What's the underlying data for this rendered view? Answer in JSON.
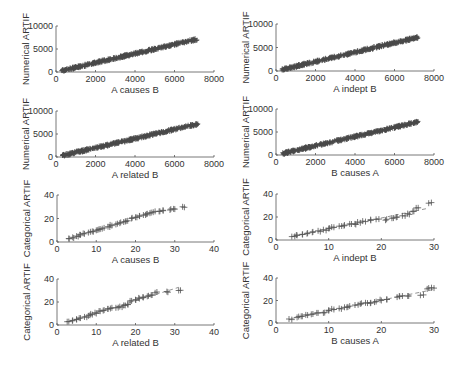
{
  "chart_data": [
    {
      "type": "scatter",
      "panel": 1,
      "xlabel": "A causes B",
      "ylabel": "Numerical ARTIF",
      "xlim": [
        0,
        8000
      ],
      "ylim": [
        0,
        10000
      ],
      "xticks": [
        0,
        2000,
        4000,
        6000,
        8000
      ],
      "yticks": [
        0,
        5000,
        10000
      ],
      "marker": "+",
      "x_range": [
        300,
        7200
      ],
      "trend": {
        "slope": 1.0,
        "intercept": 0
      },
      "x": [
        300,
        1000,
        2000,
        3000,
        4000,
        5000,
        6000,
        7000,
        7200
      ],
      "y": [
        300,
        1000,
        2000,
        3000,
        4000,
        5000,
        6000,
        7000,
        7200
      ]
    },
    {
      "type": "scatter",
      "panel": 2,
      "xlabel": "A indept B",
      "ylabel": "Numerical ARTIF",
      "xlim": [
        0,
        8000
      ],
      "ylim": [
        0,
        10000
      ],
      "xticks": [
        0,
        2000,
        4000,
        6000,
        8000
      ],
      "yticks": [
        0,
        5000,
        10000
      ],
      "marker": "+",
      "x": [
        300,
        1000,
        2000,
        3000,
        4000,
        5000,
        6000,
        7000,
        7200
      ],
      "y": [
        300,
        1000,
        2000,
        3000,
        4000,
        5000,
        6000,
        7000,
        7200
      ]
    },
    {
      "type": "scatter",
      "panel": 3,
      "xlabel": "A related B",
      "ylabel": "Numerical ARTIF",
      "xlim": [
        0,
        8000
      ],
      "ylim": [
        0,
        10000
      ],
      "xticks": [
        0,
        2000,
        4000,
        6000,
        8000
      ],
      "yticks": [
        0,
        5000,
        10000
      ],
      "marker": "+",
      "x": [
        300,
        1000,
        2000,
        3000,
        4000,
        5000,
        6000,
        7000,
        7200
      ],
      "y": [
        300,
        1000,
        2000,
        3000,
        4000,
        5000,
        6000,
        7000,
        7200
      ]
    },
    {
      "type": "scatter",
      "panel": 4,
      "xlabel": "B causes A",
      "ylabel": "Numerical ARTIF",
      "xlim": [
        0,
        8000
      ],
      "ylim": [
        0,
        10000
      ],
      "xticks": [
        0,
        2000,
        4000,
        6000,
        8000
      ],
      "yticks": [
        0,
        5000,
        10000
      ],
      "marker": "+",
      "x": [
        300,
        1000,
        2000,
        3000,
        4000,
        5000,
        6000,
        7000,
        7200
      ],
      "y": [
        300,
        1000,
        2000,
        3000,
        4000,
        5000,
        6000,
        7000,
        7200
      ]
    },
    {
      "type": "scatter",
      "panel": 5,
      "xlabel": "A causes B",
      "ylabel": "Categorical ARTIF",
      "xlim": [
        0,
        40
      ],
      "ylim": [
        0,
        40
      ],
      "xticks": [
        0,
        10,
        20,
        30,
        40
      ],
      "yticks": [
        0,
        20,
        40
      ],
      "marker": "+",
      "x": [
        3,
        4,
        5,
        6,
        7,
        8,
        9,
        10,
        11,
        12,
        13,
        14,
        15,
        16,
        17,
        18,
        19,
        20,
        21,
        22,
        23,
        24,
        25,
        26,
        27,
        29,
        30,
        32
      ],
      "y": [
        3,
        4,
        5,
        6,
        7,
        8,
        9,
        10,
        11,
        12,
        13,
        14,
        15,
        16,
        17,
        18,
        20,
        21,
        22,
        23,
        24,
        25,
        26,
        26,
        27,
        28,
        28,
        30
      ]
    },
    {
      "type": "scatter",
      "panel": 6,
      "xlabel": "A indept B",
      "ylabel": "Categorical ARTIF",
      "xlim": [
        0,
        30
      ],
      "ylim": [
        0,
        40
      ],
      "xticks": [
        0,
        10,
        20,
        30
      ],
      "yticks": [
        0,
        20,
        40
      ],
      "marker": "+",
      "fit_line": "dashed",
      "x": [
        3,
        4,
        5,
        6,
        7,
        8,
        9,
        10,
        11,
        12,
        13,
        14,
        15,
        16,
        17,
        18,
        19,
        21,
        22,
        23,
        24,
        25,
        26,
        27,
        29
      ],
      "y": [
        3,
        4,
        5,
        6,
        7,
        8,
        9,
        10,
        11,
        12,
        13,
        14,
        14,
        15,
        16,
        17,
        18,
        18,
        19,
        20,
        21,
        23,
        25,
        28,
        32
      ]
    },
    {
      "type": "scatter",
      "panel": 7,
      "xlabel": "A related B",
      "ylabel": "Categorical ARTIF",
      "xlim": [
        0,
        40
      ],
      "ylim": [
        0,
        40
      ],
      "xticks": [
        0,
        10,
        20,
        30,
        40
      ],
      "yticks": [
        0,
        20,
        40
      ],
      "marker": "+",
      "fit_line": "dashed",
      "x": [
        3,
        4,
        5,
        6,
        7,
        8,
        9,
        10,
        11,
        12,
        13,
        14,
        15,
        16,
        17,
        18,
        19,
        20,
        21,
        22,
        23,
        24,
        25,
        28,
        31
      ],
      "y": [
        3,
        4,
        5,
        6,
        7,
        8,
        9,
        10,
        12,
        13,
        14,
        15,
        15,
        16,
        17,
        18,
        21,
        22,
        23,
        24,
        25,
        26,
        28,
        29,
        30
      ]
    },
    {
      "type": "scatter",
      "panel": 8,
      "xlabel": "B causes A",
      "ylabel": "Categorical ARTIF",
      "xlim": [
        0,
        30
      ],
      "ylim": [
        0,
        40
      ],
      "xticks": [
        0,
        10,
        20,
        30
      ],
      "yticks": [
        0,
        20,
        40
      ],
      "marker": "+",
      "fit_line": "dashed",
      "x": [
        3,
        4,
        5,
        6,
        7,
        8,
        9,
        10,
        11,
        12,
        13,
        14,
        15,
        16,
        17,
        18,
        19,
        20,
        21,
        23,
        24,
        25,
        28,
        29,
        30
      ],
      "y": [
        3,
        5,
        6,
        7,
        8,
        9,
        9,
        11,
        12,
        13,
        14,
        15,
        16,
        17,
        18,
        18,
        19,
        20,
        21,
        23,
        24,
        24,
        25,
        31,
        31
      ]
    }
  ]
}
